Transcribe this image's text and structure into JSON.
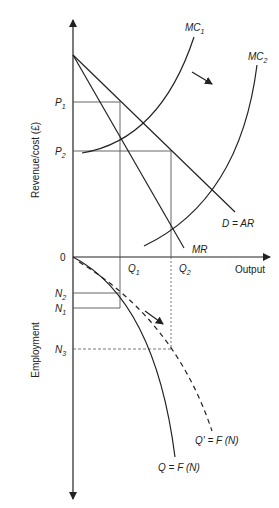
{
  "diagram": {
    "type": "economics-two-panel",
    "top_panel": {
      "y_axis_label": "Revenue/cost (£)",
      "x_axis_label": "Output",
      "origin_label": "0",
      "price_labels": [
        {
          "base": "P",
          "sub": "1"
        },
        {
          "base": "P",
          "sub": "2"
        }
      ],
      "quantity_labels": [
        {
          "base": "Q",
          "sub": "1"
        },
        {
          "base": "Q",
          "sub": "2"
        }
      ],
      "curves": {
        "mc1": {
          "base": "MC",
          "sub": "1"
        },
        "mc2": {
          "base": "MC",
          "sub": "2"
        },
        "demand": "D = AR",
        "mr": "MR"
      }
    },
    "bottom_panel": {
      "y_axis_label": "Employment",
      "employment_labels": [
        {
          "base": "N",
          "sub": "2"
        },
        {
          "base": "N",
          "sub": "1"
        },
        {
          "base": "N",
          "sub": "3"
        }
      ],
      "curves": {
        "production": "Q = F (N)",
        "production_shifted": "Q' = F (N)"
      }
    },
    "colors": {
      "line": "#222222",
      "guide": "#555555",
      "background": "#ffffff"
    }
  }
}
